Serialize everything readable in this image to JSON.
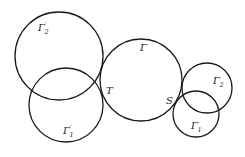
{
  "diagram": {
    "type": "circles",
    "stroke_color": "#1a1a1a",
    "background": "#ffffff",
    "circles": [
      {
        "id": "gamma2_prime",
        "label": "Γ",
        "subscript": "2",
        "prime": "′",
        "cx": 59,
        "cy": 56,
        "r": 44,
        "label_x": 38,
        "label_y": 31
      },
      {
        "id": "gamma1_prime",
        "label": "Γ",
        "subscript": "1",
        "prime": "′",
        "cx": 66,
        "cy": 105,
        "r": 37,
        "label_x": 63,
        "label_y": 134
      },
      {
        "id": "gamma",
        "label": "Γ",
        "subscript": "",
        "prime": "",
        "cx": 141,
        "cy": 80,
        "r": 41,
        "label_x": 140,
        "label_y": 51
      },
      {
        "id": "gamma2",
        "label": "Γ",
        "subscript": "2",
        "prime": "",
        "cx": 207,
        "cy": 88,
        "r": 25,
        "label_x": 213,
        "label_y": 84
      },
      {
        "id": "gamma1",
        "label": "Γ",
        "subscript": "1",
        "prime": "",
        "cx": 196,
        "cy": 114,
        "r": 23,
        "label_x": 191,
        "label_y": 129
      }
    ],
    "points": [
      {
        "id": "T",
        "label": "T",
        "x": 106,
        "y": 94
      },
      {
        "id": "S",
        "label": "S",
        "x": 166,
        "y": 104
      }
    ]
  }
}
